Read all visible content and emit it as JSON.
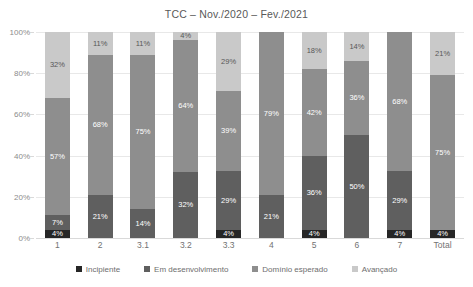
{
  "chart_data": {
    "type": "bar",
    "subtype": "stacked-100-percent",
    "title": "TCC – Nov./2020 – Fev./2021",
    "xlabel": "",
    "ylabel": "",
    "ylim": [
      0,
      100
    ],
    "yticks": [
      "0%",
      "20%",
      "40%",
      "60%",
      "80%",
      "100%"
    ],
    "ytick_values": [
      0,
      20,
      40,
      60,
      80,
      100
    ],
    "grid": true,
    "legend_position": "bottom",
    "categories": [
      "1",
      "2",
      "3.1",
      "3.2",
      "3.3",
      "4",
      "5",
      "6",
      "7",
      "Total"
    ],
    "series": [
      {
        "name": "Incipiente",
        "color": "#262626",
        "values": [
          4,
          0,
          0,
          0,
          4,
          0,
          4,
          0,
          4,
          4
        ],
        "labels": [
          "4%",
          "",
          "",
          "",
          "4%",
          "",
          "4%",
          "",
          "4%",
          "4%"
        ]
      },
      {
        "name": "Em desenvolvimento",
        "color": "#5f5f5f",
        "values": [
          7,
          21,
          14,
          32,
          29,
          21,
          36,
          50,
          29,
          0
        ],
        "labels": [
          "7%",
          "21%",
          "14%",
          "32%",
          "29%",
          "21%",
          "36%",
          "50%",
          "29%",
          ""
        ]
      },
      {
        "name": "Domínio esperado",
        "color": "#8e8e8e",
        "values": [
          57,
          68,
          75,
          64,
          39,
          79,
          42,
          36,
          68,
          75
        ],
        "labels": [
          "57%",
          "68%",
          "75%",
          "64%",
          "39%",
          "79%",
          "42%",
          "36%",
          "68%",
          "75%"
        ]
      },
      {
        "name": "Avançado",
        "color": "#c9c9c9",
        "values": [
          32,
          11,
          11,
          4,
          29,
          0,
          18,
          14,
          0,
          21
        ],
        "labels": [
          "32%",
          "11%",
          "11%",
          "4%",
          "29%",
          "",
          "18%",
          "14%",
          "",
          "21%"
        ]
      }
    ]
  },
  "legend": {
    "items": [
      {
        "label": "Incipiente",
        "color": "#262626"
      },
      {
        "label": "Em desenvolvimento",
        "color": "#5f5f5f"
      },
      {
        "label": "Domínio esperado",
        "color": "#8e8e8e"
      },
      {
        "label": "Avançado",
        "color": "#c9c9c9"
      }
    ]
  }
}
